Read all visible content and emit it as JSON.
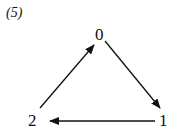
{
  "caption": "(5)",
  "nodes": [
    {
      "id": "0",
      "label": "0"
    },
    {
      "id": "1",
      "label": "1"
    },
    {
      "id": "2",
      "label": "2"
    }
  ],
  "edges": [
    {
      "from": "0",
      "to": "1"
    },
    {
      "from": "1",
      "to": "2"
    },
    {
      "from": "2",
      "to": "0"
    }
  ],
  "colors": {
    "stroke": "#111111",
    "background": "#ffffff"
  }
}
